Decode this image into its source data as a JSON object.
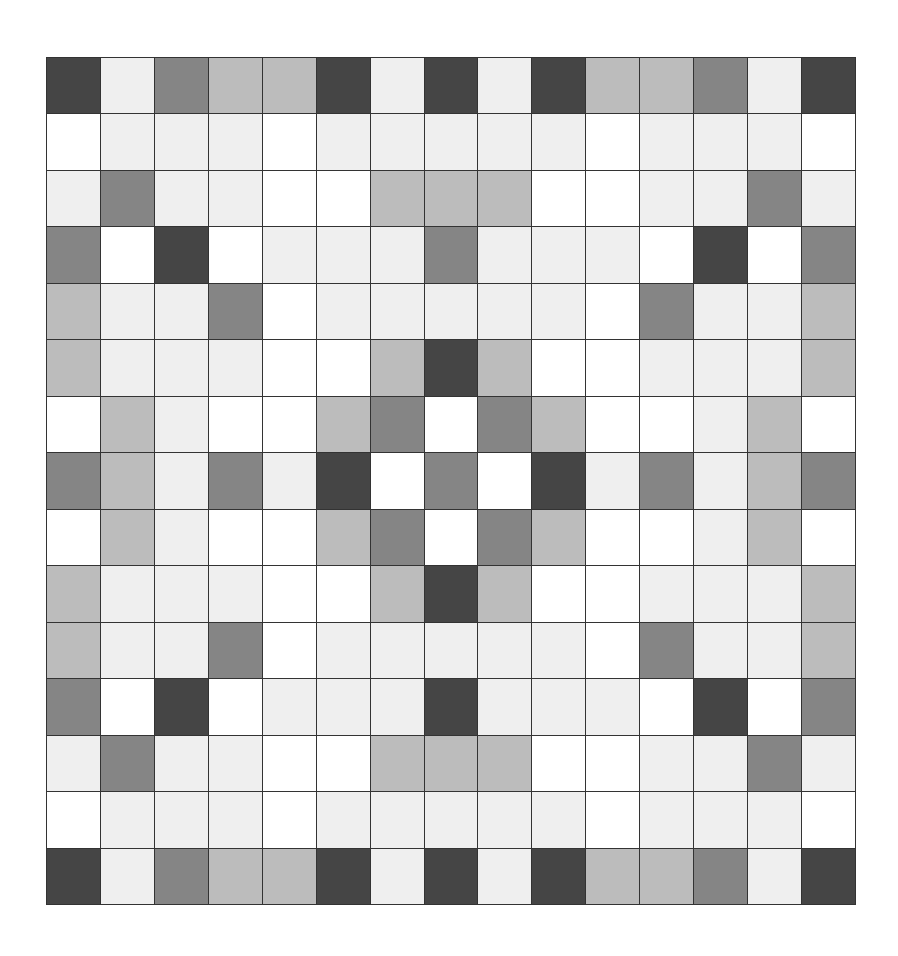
{
  "board": {
    "rows": 15,
    "cols": 15,
    "legend": {
      "D": {
        "name": "dark",
        "color": "#454545"
      },
      "M": {
        "name": "mid",
        "color": "#858585"
      },
      "L": {
        "name": "light-gray",
        "color": "#bcbcbc"
      },
      "V": {
        "name": "very-light",
        "color": "#efefef"
      },
      "W": {
        "name": "white",
        "color": "#ffffff"
      }
    },
    "grid": [
      "DVMLLDVDVDLLMVD",
      "WVVVWVVVVVWVVVW",
      "VMVVWWLLLWWVVMV",
      "MWDWVVVMVVVWDWM",
      "LVVMWVVVVVWMVVL",
      "LVVVWWLDLWWVVVL",
      "WLVWWLMWMLWWVLW",
      "MLVMVDWMWDVMVLM",
      "WLVWWLMWMLWWVLW",
      "LVVVWWLDLWWVVVL",
      "LVVMWVVVVVWMVVL",
      "MWDWVVVDVVVWDWM",
      "VMVVWWLLLWWVVMV",
      "WVVVWVVVVVWVVVW",
      "DVMLLDVDVDLLMVD"
    ]
  }
}
